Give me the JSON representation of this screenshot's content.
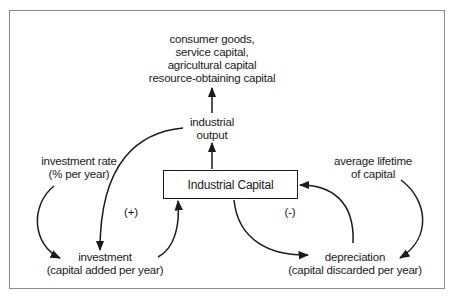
{
  "diagram": {
    "type": "causal-loop",
    "stock": {
      "label": "Industrial Capital"
    },
    "nodes": {
      "outputs_uses": {
        "lines": [
          "consumer goods,",
          "service capital,",
          "agricultural capital",
          "resource-obtaining capital"
        ]
      },
      "industrial_output": {
        "lines": [
          "industrial",
          "output"
        ]
      },
      "investment_rate": {
        "lines": [
          "investment rate",
          "(% per year)"
        ]
      },
      "average_lifetime": {
        "lines": [
          "average lifetime",
          "of capital"
        ]
      },
      "investment": {
        "lines": [
          "investment",
          "(capital added per year)"
        ]
      },
      "depreciation": {
        "lines": [
          "depreciation",
          "(capital discarded per year)"
        ]
      }
    },
    "loops": {
      "reinforcing": {
        "label": "(+)"
      },
      "balancing": {
        "label": "(-)"
      }
    },
    "edges": [
      {
        "from": "Industrial Capital",
        "to": "industrial output"
      },
      {
        "from": "industrial output",
        "to": "consumer goods, service capital, agricultural capital, resource-obtaining capital"
      },
      {
        "from": "industrial output",
        "to": "investment"
      },
      {
        "from": "investment rate",
        "to": "investment"
      },
      {
        "from": "investment",
        "to": "Industrial Capital"
      },
      {
        "from": "Industrial Capital",
        "to": "depreciation"
      },
      {
        "from": "depreciation",
        "to": "Industrial Capital"
      },
      {
        "from": "average lifetime of capital",
        "to": "depreciation"
      }
    ],
    "colors": {
      "line": "#1a1a1a",
      "frame": "#8a8a8a",
      "background": "#ffffff"
    }
  }
}
